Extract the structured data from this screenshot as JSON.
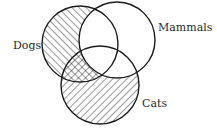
{
  "diagram": {
    "type": "venn",
    "sets": [
      {
        "name": "Dogs",
        "label": "Dogs",
        "cx": 80,
        "cy": 44,
        "r": 38,
        "hatch": "backslash"
      },
      {
        "name": "Mammals",
        "label": "Mammals",
        "cx": 117,
        "cy": 40,
        "r": 38,
        "hatch": "none"
      },
      {
        "name": "Cats",
        "label": "Cats",
        "cx": 100,
        "cy": 85,
        "r": 39,
        "hatch": "slash"
      }
    ],
    "shaded_regions": [
      {
        "region": "Dogs minus Mammals",
        "pattern": "backslash"
      },
      {
        "region": "Cats minus Mammals",
        "pattern": "slash"
      },
      {
        "region": "Dogs and Cats minus Mammals",
        "pattern": "crosshatch"
      }
    ],
    "line_color": "#1c1c1c",
    "background": "#ffffff"
  },
  "labels": {
    "dogs": "Dogs",
    "mammals": "Mammals",
    "cats": "Cats"
  }
}
